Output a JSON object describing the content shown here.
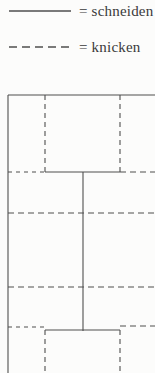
{
  "colors": {
    "background": "#fcfcfb",
    "line": "#4f4f4f",
    "text": "#3a3a3a"
  },
  "legend": {
    "items": [
      {
        "style": "solid",
        "label": "= schneiden"
      },
      {
        "style": "dashed",
        "label": "= knicken"
      }
    ]
  },
  "diagram": {
    "width": 155,
    "height": 373,
    "line_width": 1.1,
    "default_dash": "5 4",
    "segments": [
      {
        "type": "schneiden",
        "x1": 8,
        "y1": 95,
        "x2": 155,
        "y2": 95
      },
      {
        "type": "schneiden",
        "x1": 8,
        "y1": 95,
        "x2": 8,
        "y2": 373
      },
      {
        "type": "schneiden",
        "x1": 45,
        "y1": 172,
        "x2": 120,
        "y2": 172
      },
      {
        "type": "schneiden",
        "x1": 83,
        "y1": 172,
        "x2": 83,
        "y2": 331
      },
      {
        "type": "schneiden",
        "x1": 45,
        "y1": 330,
        "x2": 120,
        "y2": 330
      },
      {
        "type": "knicken",
        "x1": 45,
        "y1": 95,
        "x2": 45,
        "y2": 172,
        "dash": "5 4"
      },
      {
        "type": "knicken",
        "x1": 120,
        "y1": 95,
        "x2": 120,
        "y2": 172,
        "dash": "5 4"
      },
      {
        "type": "knicken",
        "x1": 8,
        "y1": 172,
        "x2": 45,
        "y2": 172,
        "dash": "4 4"
      },
      {
        "type": "knicken",
        "x1": 120,
        "y1": 172,
        "x2": 155,
        "y2": 172,
        "dash": "6 4"
      },
      {
        "type": "knicken",
        "x1": 8,
        "y1": 213,
        "x2": 155,
        "y2": 213,
        "dash": "6 4"
      },
      {
        "type": "knicken",
        "x1": 8,
        "y1": 287,
        "x2": 155,
        "y2": 287,
        "dash": "6 4"
      },
      {
        "type": "knicken",
        "x1": 8,
        "y1": 327,
        "x2": 45,
        "y2": 327,
        "dash": "4 4"
      },
      {
        "type": "knicken",
        "x1": 120,
        "y1": 326,
        "x2": 155,
        "y2": 326,
        "dash": "6 4"
      },
      {
        "type": "knicken",
        "x1": 45,
        "y1": 330,
        "x2": 45,
        "y2": 373,
        "dash": "5 4"
      },
      {
        "type": "knicken",
        "x1": 120,
        "y1": 330,
        "x2": 120,
        "y2": 373,
        "dash": "5 4"
      }
    ]
  }
}
